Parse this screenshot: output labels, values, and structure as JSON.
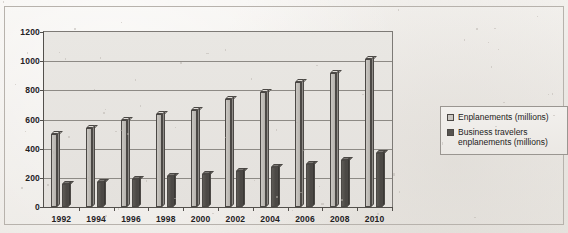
{
  "chart_data": {
    "type": "bar",
    "title": "",
    "subtitle": "",
    "xlabel": "",
    "ylabel": "",
    "categories": [
      "1992",
      "1994",
      "1996",
      "1998",
      "2000",
      "2002",
      "2004",
      "2006",
      "2008",
      "2010"
    ],
    "series": [
      {
        "name": "Enplanements (millions)",
        "color": "#c4c1bc",
        "values": [
          520,
          565,
          615,
          655,
          685,
          760,
          810,
          880,
          940,
          1035
        ]
      },
      {
        "name": "Business travelers enplanements (millions)",
        "color": "#55524e",
        "values": [
          180,
          190,
          215,
          235,
          245,
          270,
          295,
          315,
          345,
          390
        ]
      }
    ],
    "ylim": [
      0,
      1200
    ],
    "yticks": [
      0,
      200,
      400,
      600,
      800,
      1000,
      1200
    ],
    "ytick_labels": [
      "0",
      "200",
      "400",
      "600",
      "800",
      "1000",
      "1200"
    ],
    "grid": true,
    "legend_position": "right",
    "style": "3d-column"
  },
  "legend": {
    "entries": [
      {
        "label": "Enplanements (millions)",
        "swatch": "light-gray-swatch"
      },
      {
        "label": "Business travelers\nenplanements (millions)",
        "swatch": "dark-gray-swatch"
      }
    ]
  }
}
